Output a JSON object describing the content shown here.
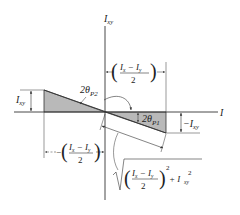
{
  "diagram": {
    "colors": {
      "line": "#333333",
      "fill": "#b9b9b9",
      "background": "#ffffff"
    },
    "axes": {
      "vertical_label_main": "I",
      "vertical_label_sub": "xy",
      "horizontal_label": "I"
    },
    "labels": {
      "ixy_left_main": "I",
      "ixy_left_sub": "xy",
      "neg_ixy_main": "−I",
      "neg_ixy_sub": "xy",
      "angle_p2_main": "2θ",
      "angle_p2_sub": "P2",
      "angle_p1_main": "2θ",
      "angle_p1_sub": "P1",
      "frac_top_num_a": "I",
      "frac_top_num_a_sub": "x",
      "frac_top_num_minus": " − ",
      "frac_top_num_b": "I",
      "frac_top_num_b_sub": "y",
      "frac_top_den": "2",
      "frac_bottom_prefix": "−",
      "frac_bottom_num_a": "I",
      "frac_bottom_num_a_sub": "x",
      "frac_bottom_num_minus": " − ",
      "frac_bottom_num_b": "I",
      "frac_bottom_num_b_sub": "y",
      "frac_bottom_den": "2",
      "radius_num_a": "I",
      "radius_num_a_sub": "x",
      "radius_num_minus": " − ",
      "radius_num_b": "I",
      "radius_num_b_sub": "y",
      "radius_den": "2",
      "radius_exp": "2",
      "radius_plus": "+ I",
      "radius_ixy_sub": "xy",
      "radius_ixy_exp": "2"
    },
    "geometry": {
      "origin": [
        105,
        112
      ],
      "left_point": [
        44,
        90
      ],
      "right_point": [
        166,
        133
      ]
    }
  }
}
